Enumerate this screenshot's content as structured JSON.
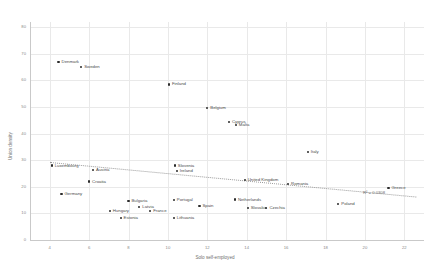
{
  "chart_data": {
    "type": "scatter",
    "title": "",
    "xlabel": "Solo self-employed",
    "ylabel": "Union density",
    "xlim": [
      3,
      23
    ],
    "ylim": [
      0,
      82
    ],
    "xticks": [
      4,
      6,
      8,
      10,
      12,
      14,
      16,
      18,
      20,
      22
    ],
    "yticks": [
      0,
      10,
      20,
      30,
      40,
      50,
      60,
      70,
      80
    ],
    "grid": true,
    "legend": "none",
    "annotations": [
      {
        "name": "r-squared",
        "text": "R² = 0.0308"
      }
    ],
    "trendline": {
      "type": "linear-dotted",
      "x_start": 4.0,
      "y_start": 29.5,
      "x_end": 22.6,
      "y_end": 16.5
    },
    "points": [
      {
        "label": "Denmark",
        "x": 4.45,
        "y": 67.0
      },
      {
        "label": "Sweden",
        "x": 5.6,
        "y": 65.2
      },
      {
        "label": "Finland",
        "x": 10.05,
        "y": 58.5
      },
      {
        "label": "Belgium",
        "x": 12.0,
        "y": 49.5
      },
      {
        "label": "Cyprus",
        "x": 13.1,
        "y": 44.3
      },
      {
        "label": "Malta",
        "x": 13.45,
        "y": 43.2
      },
      {
        "label": "Italy",
        "x": 17.1,
        "y": 33.2
      },
      {
        "label": "Luxembourg",
        "x": 4.1,
        "y": 28.0
      },
      {
        "label": "Slovenia",
        "x": 10.35,
        "y": 28.0
      },
      {
        "label": "Austria",
        "x": 6.2,
        "y": 26.3
      },
      {
        "label": "Ireland",
        "x": 10.45,
        "y": 26.0
      },
      {
        "label": "Croatia",
        "x": 6.0,
        "y": 22.0
      },
      {
        "label": "United Kingdom",
        "x": 13.9,
        "y": 22.6
      },
      {
        "label": "Romania",
        "x": 16.1,
        "y": 21.0
      },
      {
        "label": "Greece",
        "x": 21.2,
        "y": 19.5
      },
      {
        "label": "Germany",
        "x": 4.6,
        "y": 17.2
      },
      {
        "label": "Portugal",
        "x": 10.3,
        "y": 15.0
      },
      {
        "label": "Netherlands",
        "x": 13.4,
        "y": 15.2
      },
      {
        "label": "Bulgaria",
        "x": 8.0,
        "y": 14.7
      },
      {
        "label": "Poland",
        "x": 18.65,
        "y": 13.5
      },
      {
        "label": "Spain",
        "x": 11.6,
        "y": 12.8
      },
      {
        "label": "Latvia",
        "x": 8.55,
        "y": 12.3
      },
      {
        "label": "Slovakia",
        "x": 14.05,
        "y": 12.1
      },
      {
        "label": "Czechia",
        "x": 15.0,
        "y": 12.0
      },
      {
        "label": "Hungary",
        "x": 7.05,
        "y": 10.9
      },
      {
        "label": "France",
        "x": 9.1,
        "y": 10.9
      },
      {
        "label": "Estonia",
        "x": 7.6,
        "y": 8.4
      },
      {
        "label": "Lithuania",
        "x": 10.3,
        "y": 8.3
      }
    ]
  }
}
